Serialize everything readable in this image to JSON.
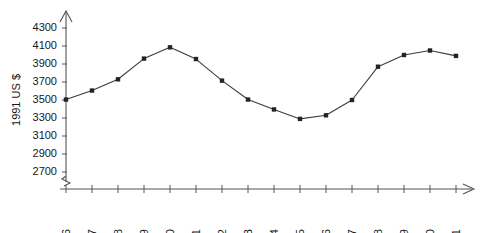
{
  "chart_data": {
    "type": "line",
    "title": "",
    "xlabel": "",
    "ylabel": "1991 US $",
    "categories": [
      "1976",
      "1977",
      "1978",
      "1979",
      "1980",
      "1981",
      "1982",
      "1983",
      "1984",
      "1985",
      "1986",
      "1987",
      "1988",
      "1989",
      "1990",
      "1991"
    ],
    "values": [
      3505,
      3605,
      3730,
      3960,
      4085,
      3955,
      3715,
      3505,
      3395,
      3290,
      3330,
      3500,
      3870,
      4000,
      4050,
      3990
    ],
    "series": [
      {
        "name": "1991 US $",
        "values": [
          3505,
          3605,
          3730,
          3960,
          4085,
          3955,
          3715,
          3505,
          3395,
          3290,
          3330,
          3500,
          3870,
          4000,
          4050,
          3990
        ]
      }
    ],
    "ytick_labels": [
      "4300",
      "4100",
      "3900",
      "3700",
      "3500",
      "3300",
      "3100",
      "2900",
      "2700"
    ],
    "ytick_values": [
      4300,
      4100,
      3900,
      3700,
      3500,
      3300,
      3100,
      2900,
      2700
    ],
    "ylim": [
      2700,
      4300
    ],
    "y_axis_break": true,
    "y_axis_break_label": "axis-break-zigzag",
    "grid": false,
    "legend": false,
    "legend_position": "none",
    "marker_style": "square",
    "line_color": "#3a3a46",
    "marker_color": "#23232c",
    "axis_color": "#555555",
    "background_color": "#ffffff",
    "x_axis_arrow": true,
    "y_axis_arrow": true
  },
  "icons": {
    "y_axis_arrow": "arrow-up-icon",
    "x_axis_arrow": "arrow-right-icon",
    "axis_break": "axis-break-icon"
  }
}
